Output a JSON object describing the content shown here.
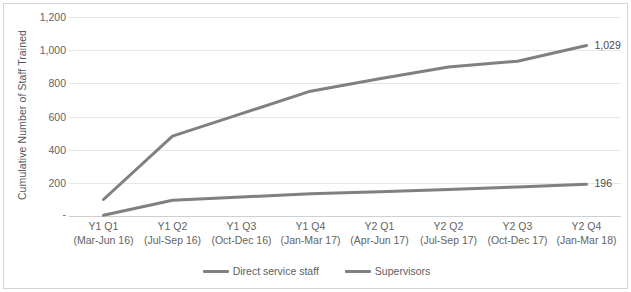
{
  "chart_data": {
    "type": "line",
    "title": "",
    "xlabel": "",
    "ylabel": "Cumulative Number of Staff Trained",
    "ylim": [
      0,
      1200
    ],
    "ytick_values": [
      1200,
      1000,
      800,
      600,
      400,
      200,
      0
    ],
    "ytick_labels": [
      "1,200",
      "1,000",
      "800",
      "600",
      "400",
      "200",
      "-"
    ],
    "grid": true,
    "legend_position": "bottom",
    "categories": [
      "Y1 Q1\n(Mar-Jun 16)",
      "Y1 Q2\n(Jul-Sep 16)",
      "Y1 Q3\n(Oct-Dec 16)",
      "Y1 Q4\n(Jan-Mar 17)",
      "Y2 Q1\n(Apr-Jun 17)",
      "Y2 Q2\n(Jul-Sep 17)",
      "Y2 Q3\n(Oct-Dec 17)",
      "Y2 Q4\n(Jan-Mar 18)"
    ],
    "category_lines": [
      {
        "line1": "Y1 Q1",
        "line2": "(Mar-Jun 16)"
      },
      {
        "line1": "Y1 Q2",
        "line2": "(Jul-Sep 16)"
      },
      {
        "line1": "Y1 Q3",
        "line2": "(Oct-Dec 16)"
      },
      {
        "line1": "Y1 Q4",
        "line2": "(Jan-Mar 17)"
      },
      {
        "line1": "Y2 Q1",
        "line2": "(Apr-Jun 17)"
      },
      {
        "line1": "Y2 Q2",
        "line2": "(Jul-Sep 17)"
      },
      {
        "line1": "Y2 Q3",
        "line2": "(Oct-Dec 17)"
      },
      {
        "line1": "Y2 Q4",
        "line2": "(Jan-Mar 18)"
      }
    ],
    "series": [
      {
        "name": "Direct service staff",
        "color": "#808080",
        "values": [
          105,
          485,
          620,
          755,
          830,
          900,
          935,
          1029
        ],
        "end_label": "1,029"
      },
      {
        "name": "Supervisors",
        "color": "#808080",
        "values": [
          10,
          100,
          120,
          140,
          152,
          165,
          180,
          196
        ],
        "end_label": "196"
      }
    ]
  },
  "axis": {
    "y_title": "Cumulative Number of Staff Trained"
  },
  "legend": {
    "items": [
      {
        "label": "Direct service staff"
      },
      {
        "label": "Supervisors"
      }
    ]
  }
}
